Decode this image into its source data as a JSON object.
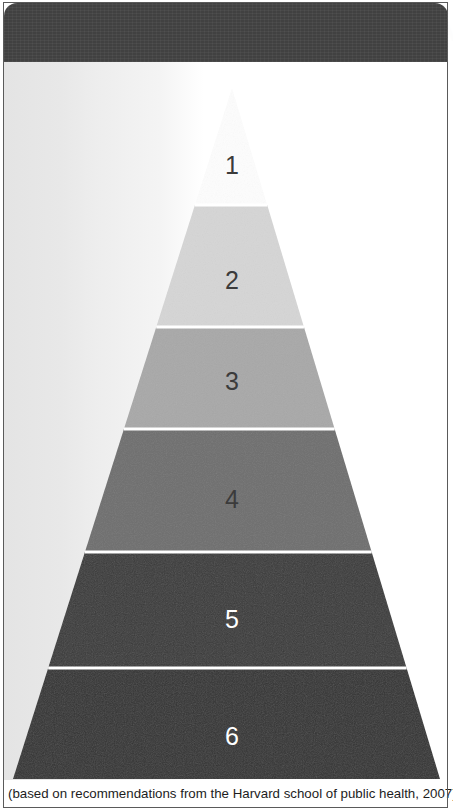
{
  "header": {
    "title": "THE HEALTHY EATING PYRAMID",
    "background_color": "#414141",
    "text_color": "#fdfdfd"
  },
  "caption": {
    "text": "(based on recommendations from the Harvard school of public health, 2007)"
  },
  "chart_data": {
    "type": "pie",
    "title": "THE HEALTHY EATING PYRAMID",
    "subtitle": "(based on recommendations from the Harvard school of public health, 2007)",
    "xlabel": "",
    "ylabel": "",
    "categories": [
      "1",
      "2",
      "3",
      "4",
      "5",
      "6"
    ],
    "values": [
      1,
      2,
      3,
      4,
      5,
      6
    ],
    "legend": "none",
    "grid": false,
    "levels": [
      {
        "number": "1",
        "position": "apex",
        "fill": "#fdfdfd",
        "text_color": "#3b3b3b"
      },
      {
        "number": "2",
        "position": "2nd from top",
        "fill": "#d5d5d5",
        "text_color": "#3b3b3b"
      },
      {
        "number": "3",
        "position": "3rd from top",
        "fill": "#a8a8a8",
        "text_color": "#3b3b3b"
      },
      {
        "number": "4",
        "position": "4th from top",
        "fill": "#6e6e6e",
        "text_color": "#3b3b3b"
      },
      {
        "number": "5",
        "position": "5th from top",
        "fill": "#3a3a3a",
        "text_color": "#ffffff"
      },
      {
        "number": "6",
        "position": "base",
        "fill": "#333333",
        "text_color": "#ffffff"
      }
    ]
  },
  "pyramid": {
    "apex": {
      "x": 232,
      "y": 88
    },
    "base": {
      "left_x": 13,
      "right_x": 440,
      "y": 779
    },
    "separator_color": "#ffffff",
    "tiers": [
      {
        "label": "1",
        "fill": "#fdfdfd",
        "text_class": "dark",
        "top": 88,
        "bottom": 205,
        "label_y": 166
      },
      {
        "label": "2",
        "fill": "#d5d5d5",
        "text_class": "dark",
        "top": 205,
        "bottom": 327,
        "label_y": 281
      },
      {
        "label": "3",
        "fill": "#a8a8a8",
        "text_class": "dark",
        "top": 327,
        "bottom": 429,
        "label_y": 382
      },
      {
        "label": "4",
        "fill": "#6e6e6e",
        "text_class": "dark",
        "top": 429,
        "bottom": 552,
        "label_y": 500
      },
      {
        "label": "5",
        "fill": "#3a3a3a",
        "text_class": "light",
        "top": 552,
        "bottom": 668,
        "label_y": 620
      },
      {
        "label": "6",
        "fill": "#333333",
        "text_class": "light",
        "top": 668,
        "bottom": 779,
        "label_y": 737
      }
    ]
  }
}
